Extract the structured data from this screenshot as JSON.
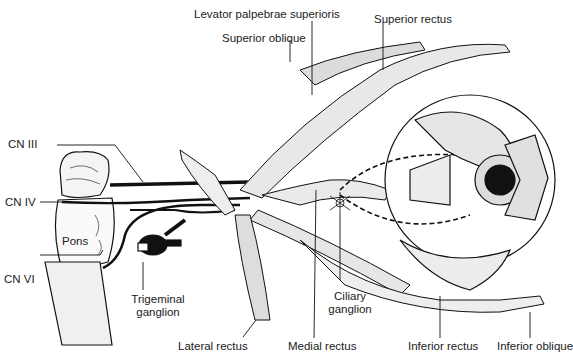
{
  "figure": {
    "labels": {
      "levator": "Levator palpebrae superioris",
      "superior_rectus": "Superior rectus",
      "superior_oblique": "Superior oblique",
      "cn3": "CN III",
      "cn4": "CN IV",
      "cn6": "CN VI",
      "pons": "Pons",
      "trigeminal_1": "Trigeminal",
      "trigeminal_2": "ganglion",
      "ciliary_1": "Ciliary",
      "ciliary_2": "ganglion",
      "lateral_rectus": "Lateral rectus",
      "medial_rectus": "Medial rectus",
      "inferior_rectus": "Inferior rectus",
      "inferior_oblique": "Inferior oblique"
    }
  }
}
